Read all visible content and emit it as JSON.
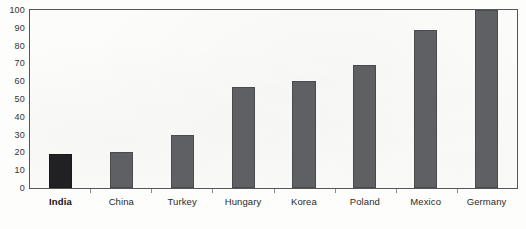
{
  "chart_data": {
    "type": "bar",
    "title": "",
    "subtitle": "",
    "xlabel": "",
    "ylabel": "",
    "ylim": [
      0,
      100
    ],
    "yticks": [
      0,
      10,
      20,
      30,
      40,
      50,
      60,
      70,
      80,
      90,
      100
    ],
    "ytick_labels": [
      "0",
      "10",
      "20",
      "30",
      "40",
      "50",
      "60",
      "70",
      "80",
      "90",
      "100"
    ],
    "grid": false,
    "legend": "none",
    "categories": [
      "India",
      "China",
      "Turkey",
      "Hungary",
      "Korea",
      "Poland",
      "Mexico",
      "Germany"
    ],
    "values": [
      19,
      20,
      30,
      57,
      60,
      69,
      89,
      100
    ],
    "highlight_category": "India",
    "bar_color": "#5f6063",
    "highlight_bar_color": "#212124",
    "bar_border_color": "#4a4b4e",
    "axis_color": "#55565a",
    "plot_background": "#fcfcfa",
    "bars": [
      {
        "label": "India",
        "value": 19,
        "highlight": true
      },
      {
        "label": "China",
        "value": 20,
        "highlight": false
      },
      {
        "label": "Turkey",
        "value": 30,
        "highlight": false
      },
      {
        "label": "Hungary",
        "value": 57,
        "highlight": false
      },
      {
        "label": "Korea",
        "value": 60,
        "highlight": false
      },
      {
        "label": "Poland",
        "value": 69,
        "highlight": false
      },
      {
        "label": "Mexico",
        "value": 89,
        "highlight": false
      },
      {
        "label": "Germany",
        "value": 100,
        "highlight": false
      }
    ]
  }
}
